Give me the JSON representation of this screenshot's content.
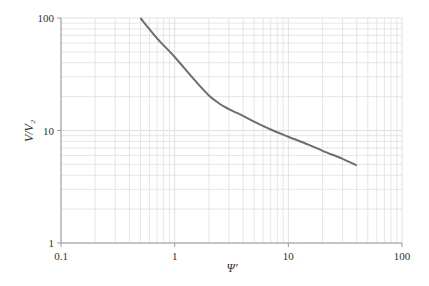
{
  "chart_data": {
    "type": "line",
    "title": "",
    "xlabel": "Ψ′",
    "ylabel": "V/V₂",
    "xscale": "log",
    "yscale": "log",
    "xlim": [
      0.1,
      100
    ],
    "ylim": [
      1,
      100
    ],
    "x_ticks": [
      0.1,
      1,
      10,
      100
    ],
    "x_tick_labels": [
      "0.1",
      "1",
      "10",
      "100"
    ],
    "y_ticks": [
      1,
      10,
      100
    ],
    "y_tick_labels": [
      "1",
      "10",
      "100"
    ],
    "grid": true,
    "legend": null,
    "series": [
      {
        "name": "V/V₂ vs Ψ′",
        "color": "#6e6e6e",
        "x": [
          0.5,
          0.7,
          1.0,
          1.5,
          2.0,
          2.5,
          3.0,
          4.0,
          5.0,
          7.0,
          10.0,
          15.0,
          20.0,
          30.0,
          40.0
        ],
        "y": [
          100,
          66,
          45,
          28,
          20.5,
          17.2,
          15.5,
          13.5,
          12.0,
          10.2,
          8.8,
          7.5,
          6.6,
          5.6,
          4.9
        ]
      }
    ]
  },
  "colors": {
    "grid": "#e0e0e0",
    "axis": "#9a9a9a",
    "curve": "#6e6e6e"
  }
}
